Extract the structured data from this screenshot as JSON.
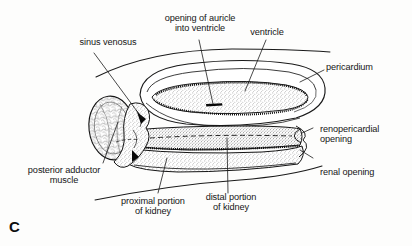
{
  "figure": {
    "letter": "C",
    "caption_letter_name": "figure-panel-letter",
    "background_color": "#fdfdfc",
    "ink_color": "#161616"
  },
  "labels": {
    "sinus_venosus": "sinus venosus",
    "opening_of_auricle": "opening of auricle\ninto ventricle",
    "ventricle": "ventricle",
    "pericardium": "pericardium",
    "renopericardial_opening": "renopericardial\nopening",
    "renal_opening": "renal opening",
    "posterior_adductor_muscle": "posterior adductor\nmuscle",
    "proximal_portion_of_kidney": "proximal portion\nof kidney",
    "distal_portion_of_kidney": "distal portion\nof kidney"
  },
  "structures": {
    "pericardium_sac": "pericardium-outline",
    "ventricle_band": "ventricle-band",
    "auricle_slit": "auricle-opening-slit",
    "kidney_tube": "kidney-tube",
    "adductor_muscle_oval": "posterior-adductor-muscle-oval",
    "mantle_curve_upper": "upper-body-wall-curve",
    "mantle_curve_lower": "lower-body-wall-curve"
  }
}
